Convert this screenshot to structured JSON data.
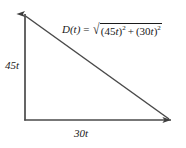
{
  "figure": {
    "name": "right-triangle-distance-diagram",
    "type": "geometric-diagram",
    "line_color": "#4a4a4a",
    "text_color": "#1a1a1a",
    "background_color": "#ffffff",
    "labels": {
      "vertical_leg": "45t",
      "horizontal_leg": "30t"
    },
    "formula": {
      "function_name": "D(t)",
      "equals": "=",
      "radical_symbol": "√",
      "term1_open": "(",
      "term1_coefficient": "45",
      "term1_variable": "t",
      "term1_close": ")",
      "term1_exponent": "2",
      "operator": "+",
      "term2_open": "(",
      "term2_coefficient": "30",
      "term2_variable": "t",
      "term2_close": ")",
      "term2_exponent": "2",
      "full_text": "D(t) = √((45t)² + (30t)²)"
    },
    "geometry": {
      "origin": [
        25,
        120
      ],
      "vertical_tip": [
        25,
        13
      ],
      "horizontal_tip": [
        172,
        120
      ],
      "hypotenuse_start": [
        25,
        16
      ],
      "hypotenuse_end": [
        169,
        119
      ]
    }
  }
}
